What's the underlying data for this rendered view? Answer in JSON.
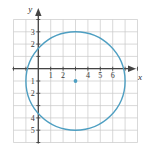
{
  "figure": {
    "name": "circle-graph",
    "axis_labels": {
      "x": "x",
      "y": "y"
    },
    "colors": {
      "curve": "#4e9fc2",
      "center_point": "#4e9fc2",
      "grid": "#c9c9c9",
      "axis": "#444444",
      "text": "#3a3a3a",
      "background": "#ffffff"
    }
  },
  "chart_data": {
    "type": "scatter",
    "title": "",
    "xlabel": "x",
    "ylabel": "y",
    "grid": true,
    "legend": null,
    "xlim": [
      -2,
      8
    ],
    "ylim": [
      -6,
      4
    ],
    "x_ticks": [
      1,
      2,
      4,
      5,
      6
    ],
    "y_ticks": [
      3,
      2,
      -1,
      -2,
      -4,
      -5
    ],
    "x_tick_labels": [
      "1",
      "2",
      "4",
      "5",
      "6"
    ],
    "y_tick_labels": [
      "3",
      "2",
      "1",
      "2",
      "4",
      "5"
    ],
    "shapes": [
      {
        "kind": "circle",
        "center": [
          3,
          -1
        ],
        "radius": 4,
        "color": "#4e9fc2",
        "filled": false,
        "linewidth": 1.4
      }
    ],
    "points": [
      {
        "x": 3,
        "y": -1,
        "label": "center",
        "color": "#4e9fc2"
      }
    ]
  }
}
